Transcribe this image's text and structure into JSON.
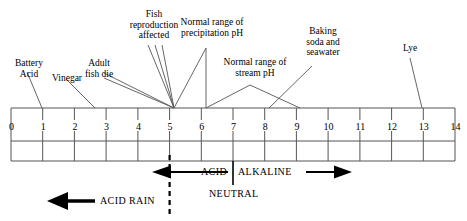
{
  "diagram": {
    "axis": {
      "min": 0,
      "max": 14,
      "tick_labels": [
        "0",
        "1",
        "2",
        "3",
        "4",
        "5",
        "6",
        "7",
        "8",
        "9",
        "10",
        "11",
        "12",
        "13",
        "14"
      ]
    },
    "callouts": [
      {
        "id": "battery-acid",
        "text": "Battery\nAcid",
        "ph": 1
      },
      {
        "id": "vinegar",
        "text": "Vinegar",
        "ph": 3
      },
      {
        "id": "adult-fish-die",
        "text": "Adult\nfish die",
        "ph": 5
      },
      {
        "id": "fish-reproduction",
        "text": "Fish\nreproduction\naffected",
        "ph": 5
      },
      {
        "id": "precipitation-ph",
        "text": "Normal range of\nprecipitation pH",
        "ph_range": [
          5,
          6
        ]
      },
      {
        "id": "stream-ph",
        "text": "Normal range of\nstream pH",
        "ph_range": [
          6,
          8
        ]
      },
      {
        "id": "baking-soda",
        "text": "Baking\nsoda and\nseawater",
        "ph": 9
      },
      {
        "id": "lye",
        "text": "Lye",
        "ph": 13
      }
    ],
    "bands": {
      "acid_label": "ACID",
      "alkaline_label": "ALKALINE",
      "neutral_label": "NEUTRAL",
      "neutral_ph": 7,
      "acid_rain_label": "ACID RAIN",
      "acid_rain_boundary_ph": 5
    },
    "colors": {
      "line": "#555555",
      "text": "#000000",
      "arrow": "#000000",
      "background": "#ffffff"
    }
  }
}
